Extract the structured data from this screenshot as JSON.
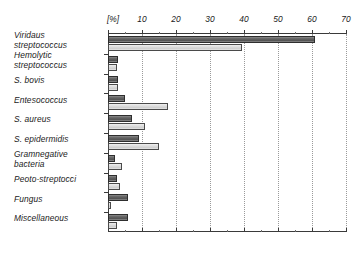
{
  "chart_data": {
    "type": "bar",
    "orientation": "horizontal",
    "title": "",
    "xlabel": "[%]",
    "ylabel": "",
    "xlim": [
      0,
      70
    ],
    "xticks": [
      0,
      10,
      20,
      30,
      40,
      50,
      60,
      70
    ],
    "xtick_labels": [
      "[%]",
      "10",
      "20",
      "30",
      "40",
      "50",
      "60",
      "70"
    ],
    "grid": true,
    "grid_axis": "x",
    "legend": "none",
    "categories": [
      "Viridaus\nstreptococcus",
      "Hemolytic\nstreptococcus",
      "S. bovis",
      "Entesococcus",
      "S. aureus",
      "S. epidermidis",
      "Gramnegative\nbacteria",
      "Peoto-streptocci",
      "Fungus",
      "Miscellaneous"
    ],
    "series": [
      {
        "name": "series-1-dark",
        "color": "#636363",
        "values": [
          61.0,
          2.8,
          2.8,
          5.0,
          7.0,
          9.0,
          2.0,
          2.5,
          6.0,
          6.0
        ]
      },
      {
        "name": "series-2-light",
        "color": "#dcdcdc",
        "values": [
          39.5,
          2.5,
          3.0,
          17.5,
          11.0,
          15.0,
          4.0,
          3.5,
          1.0,
          2.5
        ]
      }
    ]
  }
}
